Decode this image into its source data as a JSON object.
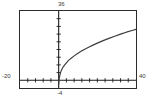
{
  "window": {
    "title": "Graphing calculator plot window"
  },
  "labels": {
    "ymax": "36",
    "ymin": "-4",
    "xmin": "-20",
    "xmax": "40"
  },
  "colors": {
    "frame": "#2b2b2b",
    "axis": "#1a1a1a",
    "curve": "#3c3c3c",
    "label_text": "#3a3a3a",
    "background": "#ffffff"
  },
  "chart_data": {
    "type": "line",
    "title": "",
    "xlabel": "",
    "ylabel": "",
    "xlim": [
      -20,
      40
    ],
    "ylim": [
      -4,
      36
    ],
    "grid": false,
    "legend": "none",
    "axis_ticks": {
      "x_tick_spacing": 4,
      "y_tick_spacing": 4,
      "x_tick_values": [
        -20,
        -16,
        -12,
        -8,
        -4,
        0,
        4,
        8,
        12,
        16,
        20,
        24,
        28,
        32,
        36,
        40
      ],
      "y_tick_values": [
        -4,
        0,
        4,
        8,
        12,
        16,
        20,
        24,
        28,
        32,
        36
      ]
    },
    "annotations": [
      {
        "text": "36",
        "position": "top of y-axis"
      },
      {
        "text": "-4",
        "position": "bottom of y-axis"
      },
      {
        "text": "-20",
        "position": "left of x-axis"
      },
      {
        "text": "40",
        "position": "right of x-axis"
      }
    ],
    "series": [
      {
        "name": "y = 6*sqrt(x)",
        "x": [
          0,
          0.2,
          0.5,
          1,
          1.5,
          2,
          3,
          4,
          5,
          6,
          8,
          10,
          12,
          14,
          16,
          18,
          20,
          23,
          26,
          29,
          32,
          35,
          38,
          40
        ],
        "y": [
          -2.2,
          0.5,
          2.2,
          4.1,
          5.4,
          6.4,
          7.9,
          9.1,
          10.2,
          11.1,
          12.7,
          14.1,
          15.3,
          16.4,
          17.4,
          18.4,
          19.3,
          20.6,
          21.8,
          22.9,
          24.0,
          25.0,
          25.9,
          26.5
        ]
      }
    ]
  }
}
